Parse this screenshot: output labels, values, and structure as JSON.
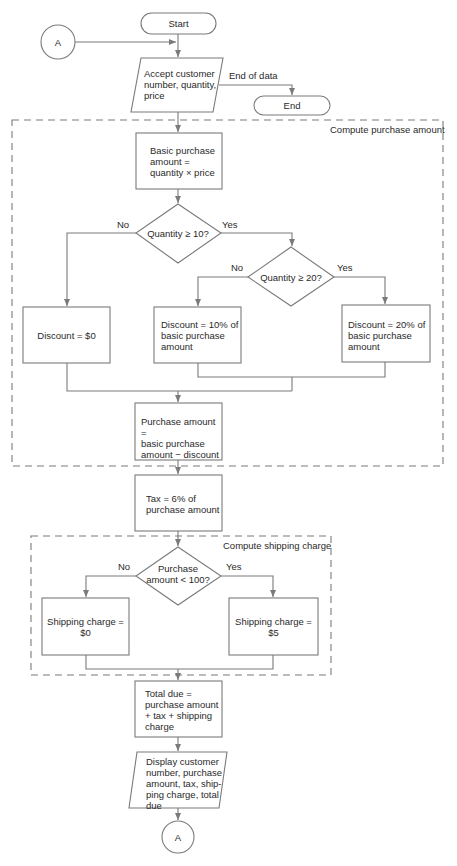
{
  "diagram": {
    "type": "flowchart",
    "connectors": {
      "top": "A",
      "bottom": "A"
    },
    "terminals": {
      "start": "Start",
      "end": "End"
    },
    "input": {
      "text": "Accept customer\nnumber, quantity,\nprice",
      "branch_label": "End of data"
    },
    "groups": {
      "purchase": "Compute purchase amount",
      "shipping": "Compute shipping charge"
    },
    "process": {
      "basic": "Basic purchase\namount =\nquantity × price",
      "discount0": "Discount = $0",
      "discount10": "Discount = 10% of\nbasic purchase\namount",
      "discount20": "Discount = 20% of\nbasic purchase\namount",
      "purchase_amount": "Purchase amount =\nbasic purchase\namount − discount",
      "tax": "Tax = 6% of\npurchase amount",
      "ship0": "Shipping charge =\n$0",
      "ship5": "Shipping charge =\n$5",
      "total": "Total due =\npurchase amount\n+ tax + shipping\ncharge"
    },
    "decisions": {
      "q10": {
        "text": "Quantity ≥ 10?",
        "no": "No",
        "yes": "Yes"
      },
      "q20": {
        "text": "Quantity ≥ 20?",
        "no": "No",
        "yes": "Yes"
      },
      "p100": {
        "text": "Purchase\namount < 100?",
        "no": "No",
        "yes": "Yes"
      }
    },
    "output": {
      "text": "Display customer\nnumber, purchase\namount, tax, ship-\nping charge, total\ndue"
    },
    "colors": {
      "line": "#7a7a7a",
      "text": "#2a2a2a",
      "background": "#ffffff"
    }
  }
}
